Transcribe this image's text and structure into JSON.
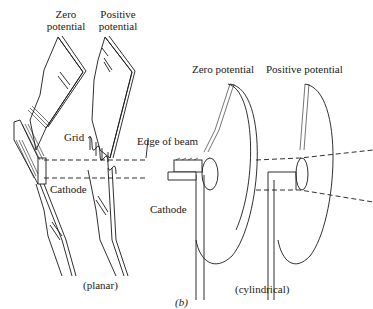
{
  "figure": {
    "panel_label": "(b)",
    "planar": {
      "caption": "(planar)",
      "labels": {
        "zero_potential_line1": "Zero",
        "zero_potential_line2": "potential",
        "positive_potential_line1": "Positive",
        "positive_potential_line2": "potential",
        "grid": "Grid",
        "cathode": "Cathode",
        "edge_of_beam": "Edge of beam"
      }
    },
    "cylindrical": {
      "caption": "(cylindrical)",
      "labels": {
        "zero_potential": "Zero potential",
        "positive_potential": "Positive potential",
        "cathode": "Cathode"
      }
    }
  }
}
